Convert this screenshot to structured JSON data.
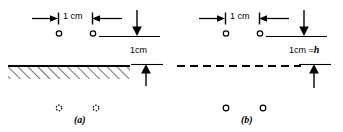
{
  "figure": {
    "type": "physics-diagram",
    "stroke_color": "#000000",
    "background_color": "#ffffff",
    "panels": [
      {
        "id": "a",
        "caption": "(a)",
        "top_span_label": "1 cm",
        "height_label": "1cm",
        "surface": "hatched-solid-boundary",
        "upper_points": 2,
        "lower_points": 2,
        "lower_point_style": "dashed"
      },
      {
        "id": "b",
        "caption": "(b)",
        "top_span_label": "1 cm",
        "height_label": "1cm = h",
        "height_label_text": "1cm =",
        "height_label_var": "h",
        "surface": "dashed-line",
        "upper_points": 2,
        "lower_points": 2,
        "lower_point_style": "solid"
      }
    ],
    "icons": {
      "span_arrow_left": "arrow-right-to-tick",
      "span_arrow_right": "arrow-left-to-tick",
      "drop_arrow": "arrow-down",
      "rise_arrow": "arrow-up"
    }
  }
}
